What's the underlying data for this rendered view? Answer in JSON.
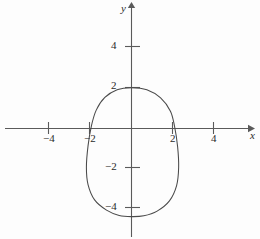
{
  "chart_data": {
    "type": "line",
    "title": "",
    "xlabel": "x",
    "ylabel": "y",
    "grid": false,
    "legend": null,
    "xlim": [
      -5.9,
      6.4
    ],
    "ylim": [
      -5.4,
      6.2
    ],
    "x_ticks": [
      -4,
      -2,
      2,
      4
    ],
    "y_ticks": [
      4,
      2,
      -2,
      -4
    ],
    "x_tick_labels": [
      "−4",
      "−2",
      "2",
      "4"
    ],
    "y_tick_labels": [
      "4",
      "2",
      "−2",
      "−4"
    ],
    "axis_arrows": [
      "x-positive",
      "y-positive"
    ],
    "series": [
      {
        "name": "closed oval curve",
        "closed": true,
        "description": "egg-shaped closed curve, narrow at the top, wide at the bottom",
        "x_intercepts": [
          -2,
          2
        ],
        "y_intercepts": [
          2,
          -4.3
        ],
        "top_vertex": [
          0,
          2
        ],
        "bottom_vertex": [
          0,
          -4.3
        ],
        "leftmost_point": [
          -2.2,
          -1.9
        ],
        "rightmost_point": [
          2.3,
          -1.9
        ],
        "points": [
          [
            0,
            2.0
          ],
          [
            0.75,
            1.9
          ],
          [
            1.42,
            1.5
          ],
          [
            1.9,
            0.85
          ],
          [
            2.1,
            0.1
          ],
          [
            2.25,
            -0.9
          ],
          [
            2.3,
            -1.9
          ],
          [
            2.2,
            -2.8
          ],
          [
            1.85,
            -3.55
          ],
          [
            1.25,
            -4.05
          ],
          [
            0.6,
            -4.28
          ],
          [
            0,
            -4.32
          ],
          [
            -0.6,
            -4.26
          ],
          [
            -1.22,
            -4.0
          ],
          [
            -1.8,
            -3.5
          ],
          [
            -2.12,
            -2.75
          ],
          [
            -2.2,
            -1.9
          ],
          [
            -2.12,
            -0.85
          ],
          [
            -1.95,
            0.15
          ],
          [
            -1.72,
            0.9
          ],
          [
            -1.3,
            1.52
          ],
          [
            -0.7,
            1.9
          ],
          [
            0,
            2.0
          ]
        ]
      }
    ]
  },
  "axes": {
    "x_axis_label": "x",
    "y_axis_label": "y"
  },
  "ticks": {
    "x_neg_4": "−4",
    "x_neg_2": "−2",
    "x_pos_2": "2",
    "x_pos_4": "4",
    "y_pos_4": "4",
    "y_pos_2": "2",
    "y_neg_2": "−2",
    "y_neg_4": "−4"
  },
  "colors": {
    "background": "#fdfdfd",
    "axis": "#5a5a5a",
    "curve": "#4a4a4a",
    "text": "#2a2a2a"
  }
}
